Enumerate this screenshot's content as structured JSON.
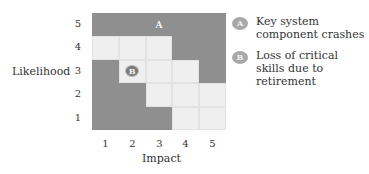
{
  "chart_data": {
    "type": "heatmap",
    "title": "",
    "xlabel": "Impact",
    "ylabel": "Likelihood",
    "x_ticks": [
      "1",
      "2",
      "3",
      "4",
      "5"
    ],
    "y_ticks": [
      "5",
      "4",
      "3",
      "2",
      "1"
    ],
    "grid_note": "rows listed top (likelihood 5) to bottom (likelihood 1); columns impact 1..5; 'dark' = shaded zone, 'light' = unshaded",
    "cells": [
      [
        "dark",
        "dark",
        "dark",
        "dark",
        "dark"
      ],
      [
        "light",
        "light",
        "light",
        "dark",
        "dark"
      ],
      [
        "dark",
        "light",
        "light",
        "light",
        "dark"
      ],
      [
        "dark",
        "dark",
        "light",
        "light",
        "light"
      ],
      [
        "dark",
        "dark",
        "dark",
        "light",
        "light"
      ]
    ],
    "markers": [
      {
        "id": "A",
        "label": "Key system component crashes",
        "likelihood": 5,
        "impact": 3
      },
      {
        "id": "B",
        "label": "Loss of critical skills due to retirement",
        "likelihood": 3,
        "impact": 2
      }
    ],
    "legend_position": "right",
    "colors": {
      "dark": "#8f8f8f",
      "light": "#efefef",
      "marker": "#7a7a7a"
    }
  },
  "legend": [
    {
      "id": "A",
      "text": "Key system component crashes"
    },
    {
      "id": "B",
      "text": "Loss of critical skills due to retirement"
    }
  ]
}
